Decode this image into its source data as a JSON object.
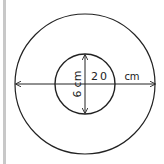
{
  "diagram": {
    "type": "concentric-circles",
    "outer_circle": {
      "label": "20 cm",
      "label_number": "20",
      "label_unit": "cm",
      "measurement": "diameter"
    },
    "inner_circle": {
      "label": "6 cm",
      "label_number": "6",
      "label_unit": "cm",
      "measurement": "diameter"
    },
    "colors": {
      "stroke": "#222222",
      "background": "#ffffff",
      "frame": "#c8c8c8"
    }
  }
}
